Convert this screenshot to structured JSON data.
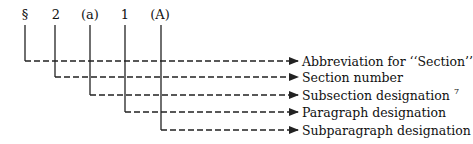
{
  "diagram": {
    "symbols": [
      {
        "text": "§",
        "x": 25
      },
      {
        "text": "2",
        "x": 56
      },
      {
        "text": "(a)",
        "x": 90
      },
      {
        "text": "1",
        "x": 125
      },
      {
        "text": "(A)",
        "x": 160
      }
    ],
    "labels": [
      {
        "text": "Abbreviation for ‘‘Section’’",
        "y": 61
      },
      {
        "text": "Section number",
        "y": 77
      },
      {
        "text": "Subsection designation",
        "sup": "7",
        "y": 95
      },
      {
        "text": "Paragraph designation",
        "y": 112
      },
      {
        "text": "Subparagraph designation",
        "y": 130
      }
    ],
    "line_color": "#222222"
  }
}
